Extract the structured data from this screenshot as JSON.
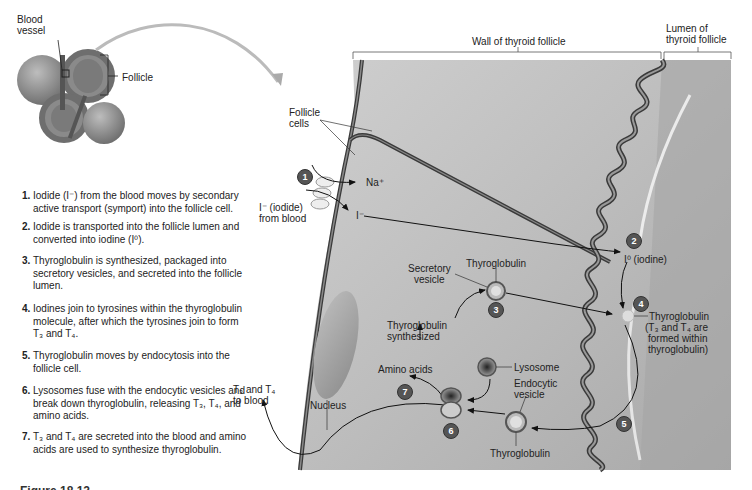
{
  "thumbnail": {
    "labels": {
      "blood_vessel": "Blood\nvessel",
      "follicle": "Follicle"
    }
  },
  "steps": [
    {
      "num": "1.",
      "text": "Iodide (I⁻) from the blood moves by secondary active transport (symport) into the follicle cell."
    },
    {
      "num": "2.",
      "text": "Iodide is transported into the follicle lumen and converted into iodine (I⁰)."
    },
    {
      "num": "3.",
      "text": "Thyroglobulin is synthesized, packaged into secretory vesicles, and secreted into the follicle lumen."
    },
    {
      "num": "4.",
      "text": "Iodines join to tyrosines within the thyroglobulin molecule, after which the tyrosines join to form T₃ and T₄."
    },
    {
      "num": "5.",
      "text": "Thyroglobulin moves by endocytosis into the follicle cell."
    },
    {
      "num": "6.",
      "text": "Lysosomes fuse with the endocytic vesicles and break down thyroglobulin, releasing T₃, T₄, and amino acids."
    },
    {
      "num": "7.",
      "text": "T₃ and T₄ are secreted into the blood and amino acids are used to synthesize thyroglobulin."
    }
  ],
  "diagram": {
    "headers": {
      "wall": "Wall of thyroid follicle",
      "lumen_line1": "Lumen of",
      "lumen_line2": "thyroid follicle"
    },
    "labels": {
      "follicle_cells_1": "Follicle",
      "follicle_cells_2": "cells",
      "na_plus": "Na⁺",
      "iodide_1": "I⁻ (iodide)",
      "iodide_2": "from blood",
      "i_minus": "I⁻",
      "iodine": "I⁰ (iodine)",
      "thyroglobulin_top": "Thyroglobulin",
      "secretory_vesicle_1": "Secretory",
      "secretory_vesicle_2": "vesicle",
      "tg_synth_1": "Thyroglobulin",
      "tg_synth_2": "synthesized",
      "amino_acids": "Amino acids",
      "lysosome": "Lysosome",
      "endocytic_1": "Endocytic",
      "endocytic_2": "vesicle",
      "thyroglobulin_bottom": "Thyroglobulin",
      "thyroglobulin_lumen": "Thyroglobulin",
      "t3t4_formed_1": "(T₃ and T₄ are",
      "t3t4_formed_2": "formed within",
      "t3t4_formed_3": "thyroglobulin)",
      "nucleus": "Nucleus",
      "to_blood_1": "T₃ and T₄",
      "to_blood_2": "to blood"
    },
    "badges": [
      "1",
      "2",
      "3",
      "4",
      "5",
      "6",
      "7"
    ]
  },
  "caption": {
    "text": "Figure 18.12"
  },
  "colors": {
    "cell_fill": "#b9b9b9",
    "membrane": "#3a3a3a",
    "badge": "#555555"
  }
}
